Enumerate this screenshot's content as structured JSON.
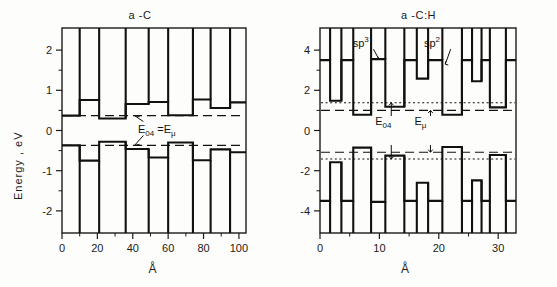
{
  "figure": {
    "axis_label_y": "Energy , eV",
    "axis_label_x": "Å"
  },
  "chart_data": [
    {
      "type": "line",
      "name": "a-C",
      "title": "a -C",
      "xlabel": "Å",
      "ylabel": "Energy , eV",
      "xlim": [
        0,
        104
      ],
      "ylim": [
        -2.55,
        2.55
      ],
      "xticks": [
        0,
        20,
        40,
        60,
        80,
        100
      ],
      "xtick_labels": [
        "0",
        "20",
        "40",
        "60",
        "80",
        "100"
      ],
      "xminor": [
        10,
        30,
        50,
        70,
        90
      ],
      "yticks": [
        2,
        1,
        0,
        -1,
        -2
      ],
      "ytick_labels": [
        "2",
        "1",
        "0",
        "-1",
        "-2"
      ],
      "yminor": [
        1.5,
        0.5,
        -0.5,
        -1.5
      ],
      "grid": false,
      "levels": [
        {
          "name": "E04_upper",
          "style": "dashed",
          "value": 0.37
        },
        {
          "name": "E04_lower",
          "style": "dashed",
          "value": -0.37
        }
      ],
      "annotations": [
        {
          "text": "E04 = Emu",
          "display": "E<sub>04</sub> =E<sub>μ</sub>",
          "x": 52,
          "y": 0.0
        }
      ],
      "series": [
        {
          "name": "conduction-band-edge",
          "type": "step",
          "x": [
            0,
            10,
            10,
            21,
            21,
            36,
            36,
            49,
            49,
            60,
            60,
            74,
            74,
            84,
            84,
            95,
            95,
            104
          ],
          "values": [
            0.37,
            0.37,
            0.76,
            0.76,
            0.3,
            0.3,
            0.66,
            0.66,
            0.71,
            0.71,
            0.38,
            0.38,
            0.77,
            0.77,
            0.56,
            0.56,
            0.7,
            0.7
          ],
          "top_clip": 2.55
        },
        {
          "name": "valence-band-edge",
          "type": "step",
          "x": [
            0,
            10,
            10,
            21,
            21,
            36,
            36,
            49,
            49,
            60,
            60,
            74,
            74,
            84,
            84,
            95,
            95,
            104
          ],
          "values": [
            -0.37,
            -0.37,
            -0.75,
            -0.75,
            -0.28,
            -0.28,
            -0.46,
            -0.46,
            -0.67,
            -0.67,
            -0.3,
            -0.3,
            -0.74,
            -0.74,
            -0.47,
            -0.47,
            -0.54,
            -0.54
          ],
          "bottom_clip": -2.55
        }
      ]
    },
    {
      "type": "line",
      "name": "a-C:H",
      "title": "a -C:H",
      "xlabel": "Å",
      "ylabel": "",
      "xlim": [
        0,
        33
      ],
      "ylim": [
        -5.1,
        5.1
      ],
      "xticks": [
        0,
        10,
        20,
        30
      ],
      "xtick_labels": [
        "0",
        "10",
        "20",
        "30"
      ],
      "xminor": [
        5,
        15,
        25
      ],
      "yticks": [
        4,
        2,
        0,
        -2,
        -4
      ],
      "ytick_labels": [
        "4",
        "2",
        "0",
        "-2",
        "-4"
      ],
      "yminor": [
        3,
        1,
        -1,
        -3
      ],
      "grid": false,
      "levels": [
        {
          "name": "E04_upper",
          "style": "dotted",
          "value": 1.38
        },
        {
          "name": "Emu_upper",
          "style": "dashed",
          "value": 1.0
        },
        {
          "name": "Emu_lower",
          "style": "dashed",
          "value": -1.08
        },
        {
          "name": "E04_lower",
          "style": "dotted",
          "value": -1.42
        }
      ],
      "annotations": [
        {
          "text": "sp3",
          "display": "sp<sup>3</sup>",
          "x": 8.2,
          "y": 4.35
        },
        {
          "text": "sp2",
          "display": "sp<sup>2</sup>",
          "x": 20.2,
          "y": 4.35
        },
        {
          "text": "E04",
          "display": "E<sub>04</sub>",
          "x": 12.0,
          "y": 0.35
        },
        {
          "text": "Emu",
          "display": "E<sub>μ</sub>",
          "x": 18.6,
          "y": 0.35
        }
      ],
      "series": [
        {
          "name": "conduction-band-edge",
          "type": "step",
          "x": [
            0,
            1.7,
            1.7,
            3.6,
            3.6,
            5.6,
            5.6,
            8.6,
            8.6,
            11.0,
            11.0,
            14.2,
            14.2,
            16.3,
            16.3,
            18.2,
            18.2,
            20.6,
            20.6,
            23.9,
            23.9,
            25.6,
            25.6,
            27.2,
            27.2,
            28.6,
            28.6,
            31.3,
            31.3,
            33.0
          ],
          "values": [
            3.5,
            3.5,
            1.48,
            1.48,
            3.5,
            3.5,
            0.78,
            0.78,
            3.55,
            3.55,
            1.18,
            1.18,
            3.5,
            3.5,
            2.58,
            2.58,
            3.5,
            3.5,
            0.78,
            0.78,
            3.5,
            3.5,
            2.45,
            2.45,
            3.5,
            3.5,
            1.15,
            1.15,
            3.5,
            3.5
          ],
          "top_clip": 5.1
        },
        {
          "name": "valence-band-edge",
          "type": "step",
          "x": [
            0,
            1.7,
            1.7,
            3.6,
            3.6,
            5.6,
            5.6,
            8.6,
            8.6,
            11.0,
            11.0,
            14.2,
            14.2,
            16.3,
            16.3,
            18.2,
            18.2,
            20.6,
            20.6,
            23.9,
            23.9,
            25.6,
            25.6,
            27.2,
            27.2,
            28.6,
            28.6,
            31.3,
            31.3,
            33.0
          ],
          "values": [
            -3.5,
            -3.5,
            -1.58,
            -1.58,
            -3.5,
            -3.5,
            -0.85,
            -0.85,
            -3.55,
            -3.55,
            -1.25,
            -1.25,
            -3.5,
            -3.5,
            -2.6,
            -2.6,
            -3.5,
            -3.5,
            -0.82,
            -0.82,
            -3.5,
            -3.5,
            -2.48,
            -2.48,
            -3.5,
            -3.5,
            -1.22,
            -1.22,
            -3.5,
            -3.5
          ],
          "bottom_clip": -5.1
        }
      ]
    }
  ]
}
